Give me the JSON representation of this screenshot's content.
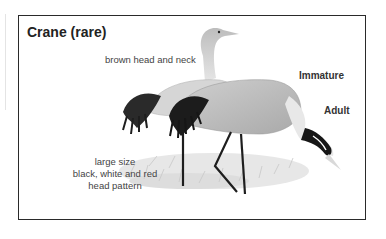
{
  "figure": {
    "title": "Crane (rare)",
    "annotations": {
      "immature_note": "brown head and neck",
      "adult_note_lines": [
        "large size",
        "black, white and red",
        "head pattern"
      ]
    },
    "labels": {
      "immature": "Immature",
      "adult": "Adult"
    },
    "colors": {
      "frame": "#2a2a2a",
      "text": "#444444",
      "plumage": "#bfbfbf",
      "dark_feathers": "#1e1e1e"
    }
  }
}
